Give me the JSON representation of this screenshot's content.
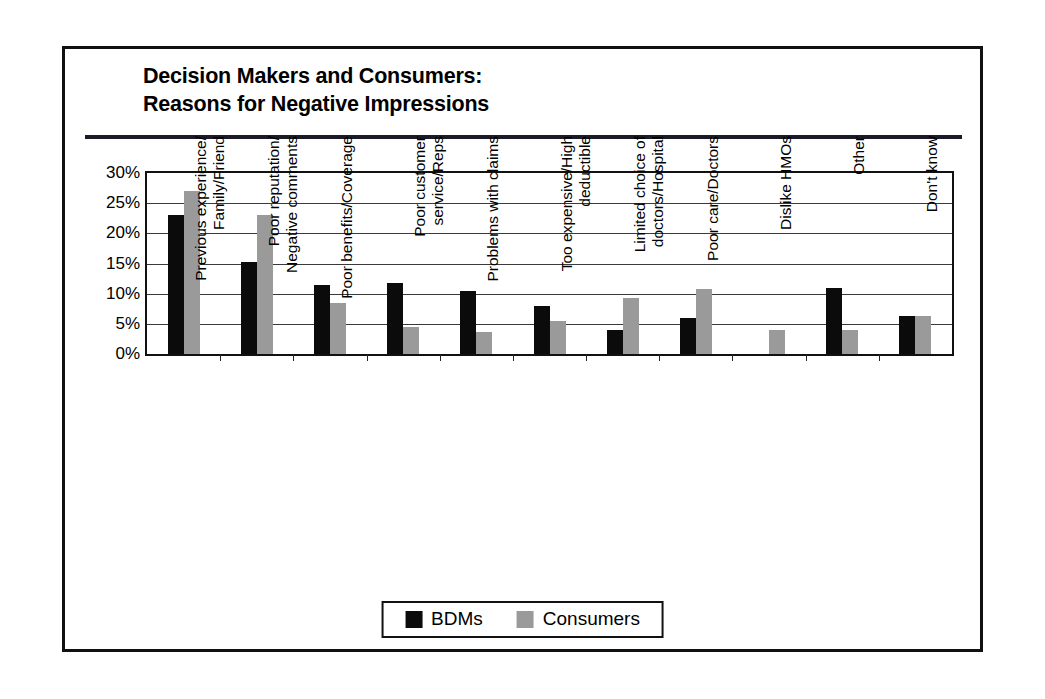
{
  "figure": {
    "title": "Decision Makers and Consumers:\nReasons for Negative Impressions",
    "border_color": "#111111",
    "background": "#ffffff"
  },
  "legend": {
    "position": "bottom-center",
    "entries": [
      {
        "label": "BDMs",
        "color": "#0b0b0b",
        "swatch": "black-square-swatch"
      },
      {
        "label": "Consumers",
        "color": "#9a9a9a",
        "swatch": "gray-square-swatch"
      }
    ]
  },
  "chart_data": {
    "type": "bar",
    "title": "Decision Makers and Consumers: Reasons for Negative Impressions",
    "xlabel": "",
    "ylabel": "",
    "ylim": [
      0,
      30
    ],
    "ytick_labels": [
      "0%",
      "5%",
      "10%",
      "15%",
      "20%",
      "25%",
      "30%"
    ],
    "ytick_values": [
      0,
      5,
      10,
      15,
      20,
      25,
      30
    ],
    "grid": true,
    "grid_axis": "y",
    "legend_position": "bottom-center",
    "categories": [
      "Previous experience/\nFamily/Friend",
      "Poor reputation/\nNegative comments",
      "Poor benefits/Coverage",
      "Poor customer\nservice/Reps",
      "Problems with claims",
      "Too expensive/High\ndeductible",
      "Limited choice of\ndoctors/Hospital",
      "Poor care/Doctors",
      "Dislike HMOs",
      "Other",
      "Don't know"
    ],
    "series": [
      {
        "name": "BDMs",
        "color": "#0b0b0b",
        "values": [
          23,
          15.2,
          11.5,
          11.8,
          10.5,
          8,
          4,
          6,
          0,
          11,
          6.3
        ]
      },
      {
        "name": "Consumers",
        "color": "#9a9a9a",
        "values": [
          27,
          23,
          8.5,
          4.5,
          3.7,
          5.5,
          9.3,
          10.8,
          4,
          4,
          6.3
        ]
      }
    ]
  }
}
